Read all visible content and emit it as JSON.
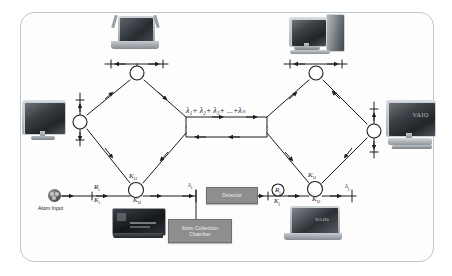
{
  "figure": {
    "type": "network-diagram",
    "frame_color": "#b9c6cf",
    "background": "#ffffff"
  },
  "labels": {
    "atom_input": "Atom Input",
    "channel_sum": "λ₁+ λ₂+ λ₃+ ...+λₙ",
    "channel_sum_parts": [
      "λ",
      "1",
      "+",
      "λ",
      "2",
      "+",
      "λ",
      "3",
      "+ ...+",
      "λ",
      "N"
    ],
    "left_R": "R",
    "left_R_sub": "i",
    "left_K": "K",
    "left_K_sub": "i",
    "left_node_top": "K",
    "left_node_top_sub": "l1",
    "left_node_bottom": "K",
    "left_node_bottom_sub": "l2",
    "left_lambda": "λ",
    "left_lambda_sub": "i",
    "right_R": "R",
    "right_R_sub": "j",
    "right_K": "K",
    "right_K_sub": "j",
    "right_node_top": "K",
    "right_node_top_sub": "l1",
    "right_node_bottom": "K",
    "right_node_bottom_sub": "l2",
    "right_lambda": "λ",
    "right_lambda_sub": "j",
    "stub_i": "i"
  },
  "boxes": {
    "detector": "Detector",
    "chamber_line1": "Atom Collection",
    "chamber_line2": "Chamber"
  },
  "devices": [
    {
      "name": "laptop-top-left",
      "kind": "laptop",
      "caption": ""
    },
    {
      "name": "desktop-top-right",
      "kind": "desktop",
      "caption": ""
    },
    {
      "name": "monitor-left",
      "kind": "monitor",
      "caption": ""
    },
    {
      "name": "monitor-right-vaio",
      "kind": "monitor",
      "caption": "VAIO"
    },
    {
      "name": "device-bottom-left",
      "kind": "console",
      "caption": ""
    },
    {
      "name": "laptop-bottom-right",
      "kind": "laptop",
      "caption": "VAIO"
    }
  ],
  "nodes": [
    {
      "name": "node-left-top",
      "x": 137,
      "y": 73
    },
    {
      "name": "node-left-mid",
      "x": 80,
      "y": 122
    },
    {
      "name": "node-left-bottom",
      "x": 136,
      "y": 190
    },
    {
      "name": "node-right-top",
      "x": 316,
      "y": 73
    },
    {
      "name": "node-right-mid",
      "x": 374,
      "y": 131
    },
    {
      "name": "node-right-bottom",
      "x": 315,
      "y": 189
    },
    {
      "name": "node-right-R",
      "x": 278,
      "y": 190
    }
  ]
}
